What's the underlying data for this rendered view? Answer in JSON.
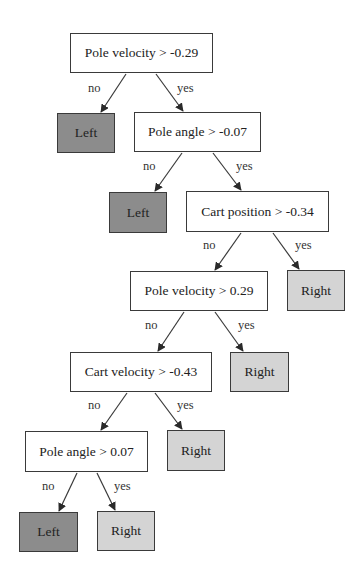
{
  "colors": {
    "border": "#3a3a3a",
    "decision_fill": "#ffffff",
    "left_fill": "#8c8c8c",
    "right_fill": "#d4d4d4",
    "edge": "#3a3a3a"
  },
  "nodes": [
    {
      "id": "n1",
      "type": "decision",
      "label": "Pole velocity > -0.29",
      "x": 70,
      "y": 33,
      "w": 143,
      "h": 40
    },
    {
      "id": "n2",
      "type": "leaf-left",
      "label": "Left",
      "x": 57,
      "y": 113,
      "w": 58,
      "h": 40
    },
    {
      "id": "n3",
      "type": "decision",
      "label": "Pole angle > -0.07",
      "x": 134,
      "y": 112,
      "w": 127,
      "h": 40
    },
    {
      "id": "n4",
      "type": "leaf-left",
      "label": "Left",
      "x": 109,
      "y": 192,
      "w": 58,
      "h": 41
    },
    {
      "id": "n5",
      "type": "decision",
      "label": "Cart position > -0.34",
      "x": 186,
      "y": 191,
      "w": 143,
      "h": 41
    },
    {
      "id": "n6",
      "type": "decision",
      "label": "Pole velocity > 0.29",
      "x": 130,
      "y": 271,
      "w": 138,
      "h": 40
    },
    {
      "id": "n7",
      "type": "leaf-right",
      "label": "Right",
      "x": 287,
      "y": 270,
      "w": 58,
      "h": 41
    },
    {
      "id": "n8",
      "type": "decision",
      "label": "Cart velocity > -0.43",
      "x": 70,
      "y": 352,
      "w": 142,
      "h": 40
    },
    {
      "id": "n9",
      "type": "leaf-right",
      "label": "Right",
      "x": 230,
      "y": 352,
      "w": 59,
      "h": 40
    },
    {
      "id": "n10",
      "type": "decision",
      "label": "Pole angle > 0.07",
      "x": 25,
      "y": 431,
      "w": 123,
      "h": 41
    },
    {
      "id": "n11",
      "type": "leaf-right",
      "label": "Right",
      "x": 167,
      "y": 430,
      "w": 58,
      "h": 41
    },
    {
      "id": "n12",
      "type": "leaf-left",
      "label": "Left",
      "x": 19,
      "y": 512,
      "w": 59,
      "h": 40
    },
    {
      "id": "n13",
      "type": "leaf-right",
      "label": "Right",
      "x": 97,
      "y": 511,
      "w": 58,
      "h": 40
    }
  ],
  "edges": [
    {
      "from": "n1",
      "to": "n2",
      "label": "no",
      "x1": 126,
      "y1": 74,
      "x2": 101,
      "y2": 112,
      "lx": 88,
      "ly": 82
    },
    {
      "from": "n1",
      "to": "n3",
      "label": "yes",
      "x1": 156,
      "y1": 74,
      "x2": 183,
      "y2": 111,
      "lx": 177,
      "ly": 82
    },
    {
      "from": "n3",
      "to": "n4",
      "label": "no",
      "x1": 182,
      "y1": 153,
      "x2": 155,
      "y2": 191,
      "lx": 143,
      "ly": 160
    },
    {
      "from": "n3",
      "to": "n5",
      "label": "yes",
      "x1": 213,
      "y1": 153,
      "x2": 241,
      "y2": 190,
      "lx": 236,
      "ly": 160
    },
    {
      "from": "n5",
      "to": "n6",
      "label": "no",
      "x1": 241,
      "y1": 233,
      "x2": 215,
      "y2": 270,
      "lx": 203,
      "ly": 239
    },
    {
      "from": "n5",
      "to": "n7",
      "label": "yes",
      "x1": 273,
      "y1": 233,
      "x2": 299,
      "y2": 269,
      "lx": 295,
      "ly": 239
    },
    {
      "from": "n6",
      "to": "n8",
      "label": "no",
      "x1": 184,
      "y1": 312,
      "x2": 158,
      "y2": 351,
      "lx": 145,
      "ly": 319
    },
    {
      "from": "n6",
      "to": "n9",
      "label": "yes",
      "x1": 215,
      "y1": 312,
      "x2": 243,
      "y2": 351,
      "lx": 238,
      "ly": 319
    },
    {
      "from": "n8",
      "to": "n10",
      "label": "no",
      "x1": 127,
      "y1": 393,
      "x2": 101,
      "y2": 430,
      "lx": 88,
      "ly": 399
    },
    {
      "from": "n8",
      "to": "n11",
      "label": "yes",
      "x1": 155,
      "y1": 393,
      "x2": 182,
      "y2": 429,
      "lx": 177,
      "ly": 399
    },
    {
      "from": "n10",
      "to": "n12",
      "label": "no",
      "x1": 77,
      "y1": 473,
      "x2": 59,
      "y2": 511,
      "lx": 42,
      "ly": 480
    },
    {
      "from": "n10",
      "to": "n13",
      "label": "yes",
      "x1": 97,
      "y1": 473,
      "x2": 115,
      "y2": 510,
      "lx": 114,
      "ly": 480
    }
  ]
}
